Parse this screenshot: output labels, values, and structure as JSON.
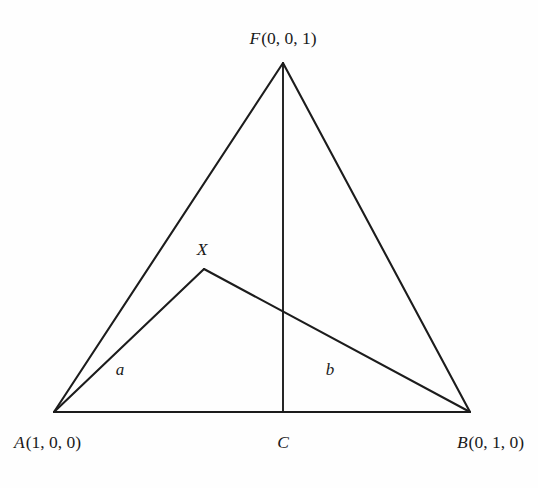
{
  "figure": {
    "type": "geometry-diagram",
    "name": "ternary-triangle-with-path",
    "background_color": "#fefefe",
    "line_color": "#1c1c1c"
  },
  "vertices": {
    "apex": {
      "id": "F",
      "symbol": "F",
      "coords_text": "(0, 0, 1)",
      "full_label": "F(0, 0, 1)",
      "x": 283,
      "y": 63
    },
    "left": {
      "id": "A",
      "symbol": "A",
      "coords_text": "(1, 0, 0)",
      "full_label": "A(1, 0, 0)",
      "x": 54,
      "y": 412
    },
    "right": {
      "id": "B",
      "symbol": "B",
      "coords_text": "(0, 1, 0)",
      "full_label": "B(0, 1, 0)",
      "x": 470,
      "y": 412
    }
  },
  "points": {
    "midpoint_base": {
      "id": "C",
      "label": "C",
      "x": 283,
      "y": 412
    },
    "interior": {
      "id": "X",
      "label": "X",
      "x": 204,
      "y": 269
    },
    "crossing": {
      "x": 283,
      "y": 312
    }
  },
  "segments": {
    "left_edge": {
      "name": "A-F",
      "from": "A",
      "to": "F"
    },
    "right_edge": {
      "name": "F-B",
      "from": "F",
      "to": "B"
    },
    "base_edge": {
      "name": "A-B",
      "from": "A",
      "to": "B"
    },
    "median": {
      "name": "F-C",
      "from": "F",
      "to": "C"
    },
    "path_a": {
      "name": "A-X",
      "from": "A",
      "to": "X",
      "label": "a",
      "label_x": 120,
      "label_y": 369
    },
    "path_b": {
      "name": "X-B",
      "from": "X",
      "to": "B",
      "label": "b",
      "label_x": 330,
      "label_y": 369
    }
  },
  "labels": {
    "apex_label": "F(0, 0, 1)",
    "apex_symbol": "F",
    "apex_coords": "(0, 0, 1)",
    "left_label": "A(1, 0, 0)",
    "left_symbol": "A",
    "left_coords": "(1, 0, 0)",
    "right_label": "B(0, 1, 0)",
    "right_symbol": "B",
    "right_coords": "(0, 1, 0)",
    "center_label": "C",
    "interior_point_label": "X",
    "segment_a_label": "a",
    "segment_b_label": "b"
  }
}
